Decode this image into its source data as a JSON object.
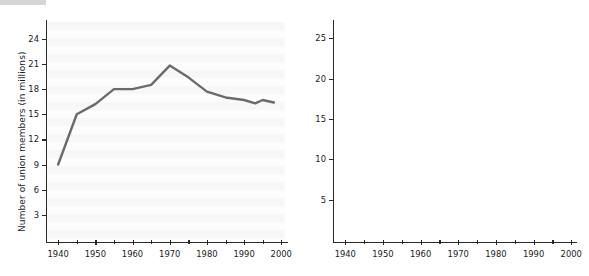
{
  "figure": {
    "panels": [
      {
        "id": "union-members-count",
        "ylabel": "Number of union members (in millions)",
        "xlabel": "",
        "line_color": "#6b6b6b",
        "background": "#fafafa"
      },
      {
        "id": "union-members-percentage",
        "ylabel": "Union members as percentage of total labor force",
        "xlabel": "",
        "line_color": "#adadad",
        "background": "#fafafa"
      }
    ]
  },
  "chart_data": [
    {
      "type": "line",
      "title": "",
      "xlabel": "",
      "ylabel": "Number of union members (in millions)",
      "xlim": [
        1937,
        2001
      ],
      "ylim": [
        0,
        26
      ],
      "xticks": [
        1940,
        1950,
        1960,
        1970,
        1980,
        1990,
        2000
      ],
      "xticklabels": [
        "1940",
        "1950",
        "1960",
        "1970",
        "1980",
        "1990",
        "2000"
      ],
      "xminorticks": [
        1945,
        1955,
        1965,
        1975,
        1985,
        1995
      ],
      "yticks": [
        3,
        6,
        9,
        12,
        15,
        18,
        21,
        24
      ],
      "yticklabels": [
        "3",
        "6",
        "9",
        "12",
        "15",
        "18",
        "21",
        "24"
      ],
      "grid": false,
      "legend": "none",
      "series": [
        {
          "name": "Union members (millions)",
          "color": "#6b6b6b",
          "x": [
            1940,
            1945,
            1950,
            1955,
            1960,
            1965,
            1970,
            1975,
            1980,
            1985,
            1990,
            1993,
            1995,
            1998
          ],
          "values": [
            9.0,
            15.0,
            16.2,
            18.0,
            18.0,
            18.5,
            20.8,
            19.4,
            17.7,
            17.0,
            16.7,
            16.3,
            16.7,
            16.4
          ]
        }
      ]
    },
    {
      "type": "line",
      "title": "",
      "xlabel": "",
      "ylabel": "Union members as percentage of total labor force",
      "xlim": [
        1937,
        2001
      ],
      "ylim": [
        0,
        27
      ],
      "xticks": [
        1940,
        1950,
        1960,
        1970,
        1980,
        1990,
        2000
      ],
      "xticklabels": [
        "1940",
        "1950",
        "1960",
        "1970",
        "1980",
        "1990",
        "2000"
      ],
      "xminorticks": [
        1945,
        1955,
        1965,
        1975,
        1985,
        1995
      ],
      "yticks": [
        5,
        10,
        15,
        20,
        25
      ],
      "yticklabels": [
        "5",
        "10",
        "15",
        "20",
        "25"
      ],
      "grid": false,
      "legend": "none",
      "series": [
        {
          "name": "Union members (% of labor force)",
          "color": "#adadad",
          "x": [
            1940,
            1945,
            1950,
            1955,
            1960,
            1965,
            1970,
            1975,
            1980,
            1985,
            1990,
            1992,
            1995,
            1998
          ],
          "values": [
            15.0,
            23.0,
            23.0,
            25.0,
            23.8,
            22.0,
            23.1,
            21.0,
            19.5,
            17.8,
            16.2,
            16.0,
            15.0,
            14.2
          ]
        }
      ]
    }
  ]
}
